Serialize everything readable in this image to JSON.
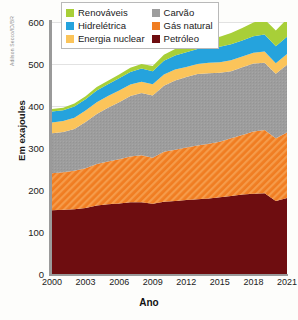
{
  "credit": "Adilson Secco/ID/BR",
  "axes": {
    "ylabel": "Em exajoules",
    "xlabel": "Ano"
  },
  "legend": {
    "items": [
      {
        "label": "Renováveis",
        "color": "#a8cf38",
        "key": "renovaveis"
      },
      {
        "label": "Carvão",
        "color": "#9d9d9d",
        "key": "carvao"
      },
      {
        "label": "Hidrelétrica",
        "color": "#25a3dd",
        "key": "hidreletrica"
      },
      {
        "label": "Gás natural",
        "color": "#f07d22",
        "key": "gas_natural"
      },
      {
        "label": "Energia nuclear",
        "color": "#fbc45a",
        "key": "energia_nuclear"
      },
      {
        "label": "Petróleo",
        "color": "#6e0d10",
        "key": "petroleo"
      }
    ]
  },
  "chart_data": {
    "type": "area",
    "stacked": true,
    "title": "",
    "xlabel": "Ano",
    "ylabel": "Em exajoules",
    "xlim": [
      2000,
      2021
    ],
    "ylim": [
      0,
      600
    ],
    "yticks": [
      0,
      100,
      200,
      300,
      400,
      500,
      600
    ],
    "xticks": [
      2000,
      2003,
      2006,
      2009,
      2012,
      2015,
      2018,
      2021
    ],
    "grid": "horizontal",
    "legend_position": "top-center",
    "x": [
      2000,
      2001,
      2002,
      2003,
      2004,
      2005,
      2006,
      2007,
      2008,
      2009,
      2010,
      2011,
      2012,
      2013,
      2014,
      2015,
      2016,
      2017,
      2018,
      2019,
      2020,
      2021
    ],
    "series": [
      {
        "name": "Petróleo",
        "color": "#6e0d10",
        "values": [
          152,
          153,
          154,
          157,
          163,
          166,
          168,
          171,
          171,
          167,
          172,
          174,
          176,
          178,
          180,
          183,
          186,
          189,
          191,
          192,
          174,
          181
        ]
      },
      {
        "name": "Gás natural",
        "color": "#f07d22",
        "hatch": "diagonal",
        "values": [
          88,
          89,
          92,
          95,
          99,
          102,
          105,
          109,
          112,
          110,
          119,
          122,
          125,
          128,
          130,
          132,
          137,
          142,
          148,
          151,
          149,
          156
        ]
      },
      {
        "name": "Carvão",
        "color": "#9d9d9d",
        "values": [
          95,
          96,
          99,
          110,
          119,
          128,
          136,
          144,
          148,
          148,
          157,
          165,
          168,
          170,
          168,
          164,
          160,
          161,
          162,
          160,
          154,
          161
        ]
      },
      {
        "name": "Energia nuclear",
        "color": "#fbc45a",
        "values": [
          26,
          26,
          27,
          27,
          28,
          28,
          28,
          27,
          27,
          27,
          27,
          26,
          24,
          24,
          25,
          25,
          26,
          26,
          26,
          27,
          25,
          26
        ]
      },
      {
        "name": "Hidrelétrica",
        "color": "#25a3dd",
        "values": [
          26,
          26,
          27,
          27,
          28,
          28,
          29,
          30,
          31,
          31,
          33,
          33,
          35,
          36,
          37,
          37,
          38,
          38,
          39,
          40,
          40,
          41
        ]
      },
      {
        "name": "Renováveis",
        "color": "#a8cf38",
        "values": [
          6,
          6,
          7,
          7,
          8,
          8,
          9,
          10,
          11,
          12,
          14,
          16,
          18,
          20,
          22,
          24,
          27,
          30,
          33,
          36,
          38,
          42
        ]
      }
    ]
  }
}
